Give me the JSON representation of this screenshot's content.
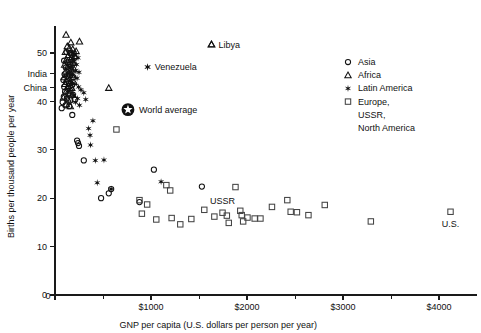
{
  "chart_data": {
    "type": "scatter",
    "title": "",
    "xlabel": "GNP per capita (U.S. dollars per person per year)",
    "ylabel": "Births per thousand people per year",
    "xlim": [
      0,
      4400
    ],
    "ylim": [
      0,
      55
    ],
    "xticks": [
      0,
      1000,
      2000,
      3000,
      4000
    ],
    "xticklabels": [
      "0",
      "$1000",
      "$2000",
      "$3000",
      "$4000"
    ],
    "xminorticks": [
      500,
      1500,
      2500,
      3500
    ],
    "yticks": [
      0,
      10,
      20,
      30,
      40,
      50
    ],
    "yticklabels": [
      "0",
      "10",
      "20",
      "30",
      "40",
      "50"
    ],
    "grid": false,
    "legend_position": "upper right",
    "series": [
      {
        "name": "Asia",
        "marker": "circle",
        "points": [
          [
            120,
            50.2
          ],
          [
            155,
            50.0
          ],
          [
            175,
            49.6
          ],
          [
            195,
            49.9
          ],
          [
            205,
            49.0
          ],
          [
            95,
            48.4
          ],
          [
            130,
            48.0
          ],
          [
            160,
            47.6
          ],
          [
            185,
            47.9
          ],
          [
            112,
            47.0
          ],
          [
            140,
            46.4
          ],
          [
            172,
            46.0
          ],
          [
            100,
            45.6
          ],
          [
            126,
            45.2
          ],
          [
            158,
            45.4
          ],
          [
            190,
            45.0
          ],
          [
            88,
            44.4
          ],
          [
            118,
            44.0
          ],
          [
            146,
            43.8
          ],
          [
            178,
            43.4
          ],
          [
            96,
            43.0
          ],
          [
            132,
            42.6
          ],
          [
            165,
            42.8
          ],
          [
            105,
            42.0
          ],
          [
            140,
            41.6
          ],
          [
            186,
            41.4
          ],
          [
            92,
            41.0
          ],
          [
            124,
            40.6
          ],
          [
            160,
            40.2
          ],
          [
            205,
            40.4
          ],
          [
            80,
            39.8
          ],
          [
            110,
            39.2
          ],
          [
            148,
            39.0
          ],
          [
            70,
            38.6
          ],
          [
            180,
            37.2
          ],
          [
            230,
            31.9
          ],
          [
            240,
            31.4
          ],
          [
            250,
            30.8
          ],
          [
            300,
            27.8
          ],
          [
            480,
            20.0
          ],
          [
            560,
            21.0
          ],
          [
            585,
            21.9
          ],
          [
            880,
            19.2
          ],
          [
            1030,
            25.9
          ],
          [
            1530,
            22.4
          ]
        ]
      },
      {
        "name": "Africa",
        "marker": "triangle",
        "points": [
          [
            115,
            53.8
          ],
          [
            165,
            52.2
          ],
          [
            255,
            52.4
          ],
          [
            128,
            51.4
          ],
          [
            150,
            51.0
          ],
          [
            185,
            50.8
          ],
          [
            220,
            50.4
          ],
          [
            108,
            50.2
          ],
          [
            140,
            49.6
          ],
          [
            175,
            49.2
          ],
          [
            205,
            49.4
          ],
          [
            118,
            48.6
          ],
          [
            152,
            48.2
          ],
          [
            190,
            48.0
          ],
          [
            100,
            47.6
          ],
          [
            132,
            47.2
          ],
          [
            168,
            46.8
          ],
          [
            200,
            46.6
          ],
          [
            110,
            46.2
          ],
          [
            145,
            45.8
          ],
          [
            178,
            45.4
          ],
          [
            95,
            45.0
          ],
          [
            128,
            44.6
          ],
          [
            162,
            44.2
          ],
          [
            198,
            44.0
          ],
          [
            105,
            43.6
          ],
          [
            140,
            43.2
          ],
          [
            175,
            42.8
          ],
          [
            120,
            42.2
          ],
          [
            158,
            41.8
          ],
          [
            185,
            41.4
          ],
          [
            88,
            40.8
          ],
          [
            135,
            40.4
          ],
          [
            118,
            39.4
          ],
          [
            160,
            39.0
          ],
          [
            560,
            42.8
          ],
          [
            1630,
            51.8
          ]
        ]
      },
      {
        "name": "Latin America",
        "marker": "star",
        "points": [
          [
            205,
            49.6
          ],
          [
            240,
            49.0
          ],
          [
            190,
            48.2
          ],
          [
            225,
            47.6
          ],
          [
            170,
            47.0
          ],
          [
            215,
            46.4
          ],
          [
            250,
            46.0
          ],
          [
            185,
            45.4
          ],
          [
            230,
            44.8
          ],
          [
            160,
            44.2
          ],
          [
            200,
            43.6
          ],
          [
            245,
            43.0
          ],
          [
            270,
            42.4
          ],
          [
            300,
            41.8
          ],
          [
            195,
            41.2
          ],
          [
            235,
            40.6
          ],
          [
            215,
            39.8
          ],
          [
            255,
            39.2
          ],
          [
            320,
            40.4
          ],
          [
            395,
            36.0
          ],
          [
            350,
            34.4
          ],
          [
            365,
            33.0
          ],
          [
            370,
            31.0
          ],
          [
            420,
            27.8
          ],
          [
            510,
            27.9
          ],
          [
            440,
            23.2
          ],
          [
            585,
            21.9
          ],
          [
            965,
            47.1
          ],
          [
            1105,
            23.4
          ]
        ]
      },
      {
        "name": "Europe, USSR, North America",
        "marker": "square",
        "points": [
          [
            640,
            34.2
          ],
          [
            880,
            19.6
          ],
          [
            960,
            18.7
          ],
          [
            905,
            16.8
          ],
          [
            1055,
            15.6
          ],
          [
            1215,
            15.9
          ],
          [
            1160,
            22.7
          ],
          [
            1200,
            21.6
          ],
          [
            1305,
            14.6
          ],
          [
            1420,
            15.7
          ],
          [
            1555,
            17.6
          ],
          [
            1660,
            16.2
          ],
          [
            1745,
            17.0
          ],
          [
            1790,
            16.4
          ],
          [
            1810,
            14.9
          ],
          [
            1880,
            22.3
          ],
          [
            1930,
            17.4
          ],
          [
            1945,
            16.5
          ],
          [
            1960,
            15.2
          ],
          [
            2005,
            16.0
          ],
          [
            2080,
            15.8
          ],
          [
            2140,
            15.8
          ],
          [
            2260,
            18.2
          ],
          [
            2420,
            19.6
          ],
          [
            2455,
            17.2
          ],
          [
            2520,
            17.1
          ],
          [
            2640,
            16.5
          ],
          [
            2810,
            18.6
          ],
          [
            3290,
            15.2
          ],
          [
            4120,
            17.2
          ]
        ]
      }
    ],
    "annotations": [
      {
        "text": "India",
        "axis": "y",
        "value": 45.8,
        "side": "left"
      },
      {
        "text": "China",
        "axis": "y",
        "value": 42.9,
        "side": "left"
      },
      {
        "text": "Libya",
        "x": 1630,
        "y": 51.8,
        "marker": "triangle"
      },
      {
        "text": "Venezuela",
        "x": 965,
        "y": 47.1,
        "marker": "star"
      },
      {
        "text": "World average",
        "x": 760,
        "y": 38.3,
        "marker": "worldaverage"
      },
      {
        "text": "USSR",
        "x": 1745,
        "y": 19.6,
        "marker": "none"
      },
      {
        "text": "U.S.",
        "x": 4120,
        "y": 14.7,
        "marker": "none"
      }
    ]
  },
  "legend": {
    "entries": [
      {
        "label": "Asia",
        "marker": "circle"
      },
      {
        "label": "Africa",
        "marker": "triangle"
      },
      {
        "label": "Latin America",
        "marker": "star"
      },
      {
        "label": "Europe,",
        "marker": "square"
      },
      {
        "label": "USSR,",
        "marker": "none"
      },
      {
        "label": "North America",
        "marker": "none"
      }
    ]
  },
  "axes": {
    "x_title": "GNP per capita (U.S. dollars per person per year)",
    "y_title": "Births per thousand people per year",
    "x_tick_labels": [
      "0",
      "$1000",
      "$2000",
      "$3000",
      "$4000"
    ],
    "y_tick_labels": [
      "0",
      "10",
      "20",
      "30",
      "40",
      "50"
    ]
  },
  "colors": {
    "ink": "#111111",
    "square_ink": "#444444",
    "background": "#ffffff"
  }
}
